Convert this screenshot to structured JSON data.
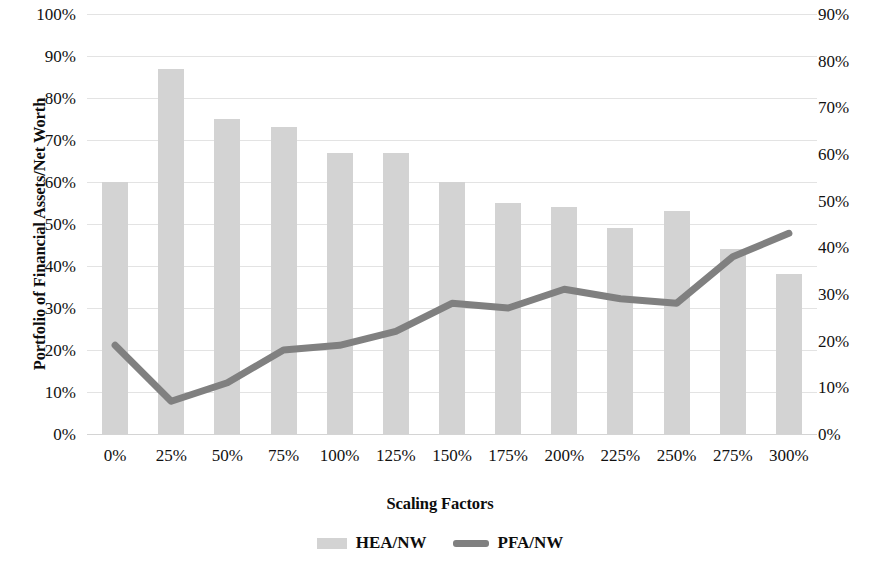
{
  "chart_data": {
    "type": "bar",
    "title": "",
    "xlabel": "Scaling Factors",
    "ylabel": "Portfolio of Financial Assets/Net Worth",
    "y2label": "Home Equity Assets/Net Worth",
    "categories": [
      "0%",
      "25%",
      "50%",
      "75%",
      "100%",
      "125%",
      "150%",
      "175%",
      "200%",
      "225%",
      "250%",
      "275%",
      "300%"
    ],
    "ylim": [
      0,
      100
    ],
    "y2lim": [
      0,
      90
    ],
    "yticks": [
      "100%",
      "90%",
      "80%",
      "70%",
      "60%",
      "50%",
      "40%",
      "30%",
      "20%",
      "10%",
      "0%"
    ],
    "ytick_values": [
      100,
      90,
      80,
      70,
      60,
      50,
      40,
      30,
      20,
      10,
      0
    ],
    "y2ticks": [
      "90%",
      "80%",
      "70%",
      "60%",
      "50%",
      "40%",
      "30%",
      "20%",
      "10%",
      "0%"
    ],
    "y2tick_values": [
      90,
      80,
      70,
      60,
      50,
      40,
      30,
      20,
      10,
      0
    ],
    "grid": true,
    "legend_position": "bottom",
    "series": [
      {
        "name": "HEA/NW",
        "type": "bar",
        "axis": "left",
        "color": "#d3d3d3",
        "values": [
          60,
          87,
          75,
          73,
          67,
          67,
          60,
          55,
          54,
          49,
          53,
          44,
          38
        ]
      },
      {
        "name": "PFA/NW",
        "type": "line",
        "axis": "right",
        "color": "#808080",
        "values": [
          19,
          7,
          11,
          18,
          19,
          22,
          28,
          27,
          31,
          29,
          28,
          38,
          43
        ]
      }
    ]
  },
  "legend": {
    "items": [
      {
        "label": "HEA/NW",
        "swatch": "bar-swatch",
        "color": "#d3d3d3"
      },
      {
        "label": "PFA/NW",
        "swatch": "line-swatch",
        "color": "#808080"
      }
    ]
  }
}
